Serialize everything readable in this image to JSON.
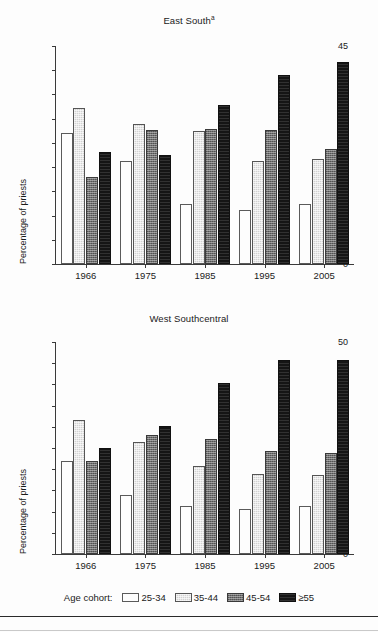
{
  "figure": {
    "background": "#fdfdfd",
    "legend_title": "Age cohort:",
    "ylabel": "Percentage of priests"
  },
  "legend": {
    "title": "Age cohort:",
    "items": [
      {
        "label": "25-34",
        "color": "#fdfdfd",
        "key": "c0"
      },
      {
        "label": "35-44",
        "color": "#d2d2d2",
        "key": "c1"
      },
      {
        "label": "45-54",
        "color": "#6f6f6f",
        "key": "c2"
      },
      {
        "label": "≥55",
        "color": "#151515",
        "key": "c3"
      }
    ]
  },
  "chart_data": [
    {
      "type": "bar",
      "title": "East South",
      "title_superscript": "a",
      "xlabel": "",
      "ylabel": "Percentage of priests",
      "ylim": [
        0,
        45
      ],
      "yticks": [
        0,
        5,
        10,
        15,
        20,
        25,
        30,
        35,
        40,
        45
      ],
      "grid": false,
      "legend_position": "bottom",
      "categories": [
        "1966",
        "1975",
        "1985",
        "1995",
        "2005"
      ],
      "series": [
        {
          "name": "25-34",
          "values": [
            27.0,
            21.3,
            12.3,
            11.1,
            12.3
          ]
        },
        {
          "name": "35-44",
          "values": [
            32.3,
            29.0,
            27.4,
            21.3,
            21.6
          ]
        },
        {
          "name": "45-54",
          "values": [
            17.9,
            27.7,
            27.9,
            27.6,
            23.8
          ]
        },
        {
          "name": "≥55",
          "values": [
            23.2,
            22.5,
            32.8,
            39.1,
            41.6
          ]
        }
      ]
    },
    {
      "type": "bar",
      "title": "West Southcentral",
      "title_superscript": "",
      "xlabel": "",
      "ylabel": "Percentage of priests",
      "ylim": [
        0,
        50
      ],
      "yticks": [
        0,
        5,
        10,
        15,
        20,
        25,
        30,
        35,
        40,
        45,
        50
      ],
      "grid": false,
      "legend_position": "bottom",
      "categories": [
        "1966",
        "1975",
        "1985",
        "1995",
        "2005"
      ],
      "series": [
        {
          "name": "25-34",
          "values": [
            21.9,
            14.0,
            11.3,
            10.5,
            11.3
          ]
        },
        {
          "name": "35-44",
          "values": [
            31.7,
            26.5,
            20.8,
            18.8,
            18.7
          ]
        },
        {
          "name": "45-54",
          "values": [
            21.9,
            28.1,
            27.1,
            24.3,
            23.8
          ]
        },
        {
          "name": "≥55",
          "values": [
            24.9,
            30.3,
            40.3,
            45.8,
            45.7
          ]
        }
      ]
    }
  ]
}
